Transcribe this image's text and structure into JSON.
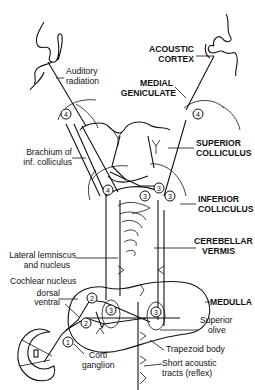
{
  "diagram": {
    "labels": {
      "auditory_radiation": [
        "Auditory",
        "radiation"
      ],
      "acoustic_cortex": [
        "ACOUSTIC",
        "CORTEX"
      ],
      "medial_geniculate": [
        "MEDIAL",
        "GENICULATE"
      ],
      "brachium": [
        "Brachium of",
        "inf. colliculus"
      ],
      "superior_colliculus": [
        "SUPERIOR",
        "COLLICULUS"
      ],
      "inferior_colliculus": [
        "INFERIOR",
        "COLLICULUS"
      ],
      "cerebellar_vermis": [
        "CEREBELLAR",
        "VERMIS"
      ],
      "lateral_lemniscus": [
        "Lateral lemniscus",
        "and nucleus"
      ],
      "cochlear_nucleus": "Cochlear nucleus",
      "dorsal": "dorsal",
      "ventral": "ventral",
      "medulla": "MEDULLA",
      "superior_olive": [
        "Superior",
        "olive"
      ],
      "corti_ganglion": [
        "Corti",
        "ganglion"
      ],
      "trapezoid_body": "Trapezoid body",
      "short_acoustic": [
        "Short acoustic",
        "tracts (reflex)"
      ]
    },
    "neuron_orders": {
      "corti": "1",
      "cochlear_dorsal": "2",
      "cochlear_ventral": "2",
      "olive_left": "3",
      "olive_right": "3",
      "inf_coll_left": "3",
      "inf_coll_mid": "3",
      "inf_coll_right": "3",
      "inf_coll_top": "3",
      "brachium_node": "4",
      "geniculate_left": "4",
      "geniculate_right": "4"
    }
  }
}
